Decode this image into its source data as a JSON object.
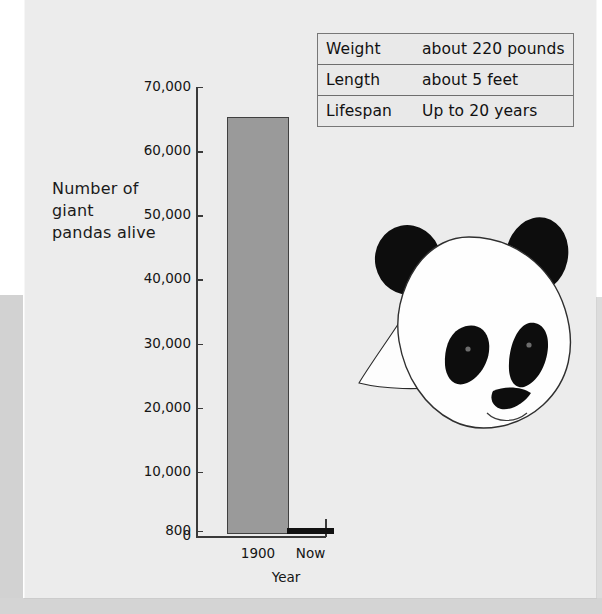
{
  "facts_table": {
    "rows": [
      {
        "label": "Weight",
        "value": "about 220 pounds"
      },
      {
        "label": "Length",
        "value": "about 5 feet"
      },
      {
        "label": "Lifespan",
        "value": "Up to 20 years"
      }
    ]
  },
  "chart_data": {
    "type": "bar",
    "title": "",
    "categories": [
      "1900",
      "Now"
    ],
    "values": [
      65000,
      800
    ],
    "xlabel": "Year",
    "ylabel": "Number of giant pandas alive",
    "ylim": [
      0,
      70000
    ],
    "ytick_labels": [
      "70,000",
      "60,000",
      "50,000",
      "40,000",
      "30,000",
      "20,000",
      "10,000",
      "800",
      "0"
    ],
    "ytick_values": [
      70000,
      60000,
      50000,
      40000,
      30000,
      20000,
      10000,
      800,
      0
    ],
    "grid": false,
    "legend": "none",
    "bar_colors": [
      "#9a9a9a",
      "#111111"
    ]
  },
  "illustration": {
    "label": "giant panda head"
  },
  "colors": {
    "panel": "#ececec",
    "page": "#ffffff",
    "band": "#d2d2d2",
    "axis": "#3a3a3a",
    "bar_1900": "#9a9a9a",
    "bar_now": "#111111",
    "table_border": "#777777"
  }
}
